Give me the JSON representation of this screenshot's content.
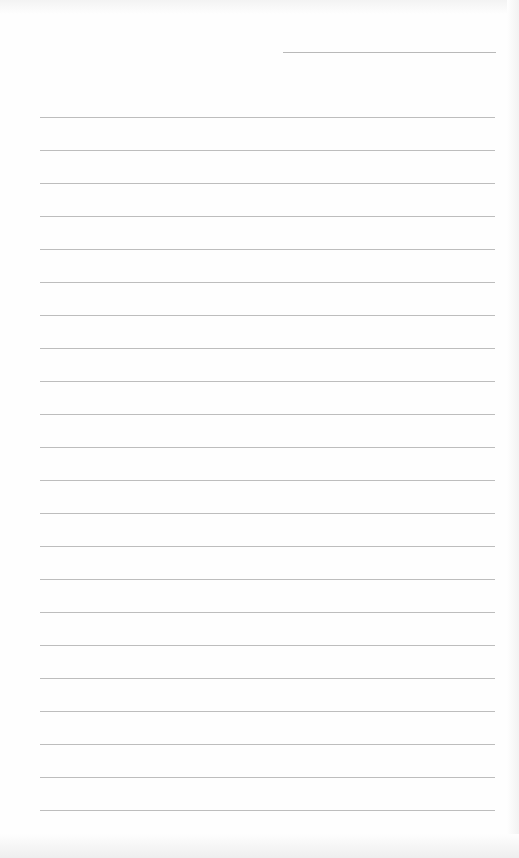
{
  "page": {
    "type": "blank lined writing sheet",
    "header_line": {
      "label": ""
    },
    "ruled_lines": {
      "count": 22,
      "first_y": 117,
      "spacing": 33,
      "lines": [
        "",
        "",
        "",
        "",
        "",
        "",
        "",
        "",
        "",
        "",
        "",
        "",
        "",
        "",
        "",
        "",
        "",
        "",
        "",
        "",
        "",
        ""
      ]
    }
  }
}
